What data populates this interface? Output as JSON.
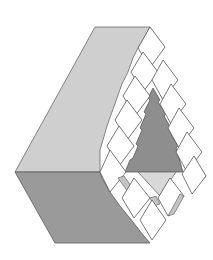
{
  "figure": {
    "colors": {
      "light_face": "#cfcfcf",
      "dark_face": "#9a9a9a",
      "inner_triangle": "#8e8e8e",
      "pale_triangle": "#d8d8d8",
      "cube_top": "#ffffff",
      "cube_side": "#c4c4c4",
      "outline": "#5a5a5a"
    }
  }
}
